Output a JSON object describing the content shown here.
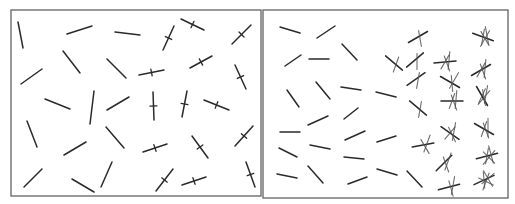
{
  "figure": {
    "width": 515,
    "height": 204,
    "stroke_color": "#2a2a2a",
    "frame_color": "#6e6e6e",
    "background": "#ffffff"
  },
  "panels": [
    {
      "id": "left",
      "frame": {
        "x": 11,
        "y": 10,
        "w": 250,
        "h": 186
      },
      "segments": [
        [
          18,
          22,
          23,
          48,
          0
        ],
        [
          67,
          34,
          92,
          26,
          0
        ],
        [
          115,
          32,
          140,
          35,
          0
        ],
        [
          163,
          50,
          174,
          26,
          1
        ],
        [
          181,
          19,
          204,
          30,
          1
        ],
        [
          232,
          44,
          251,
          25,
          1
        ],
        [
          21,
          84,
          42,
          69,
          0
        ],
        [
          63,
          51,
          80,
          73,
          0
        ],
        [
          107,
          59,
          126,
          78,
          0
        ],
        [
          139,
          75,
          164,
          70,
          1
        ],
        [
          190,
          68,
          212,
          56,
          1
        ],
        [
          235,
          65,
          246,
          89,
          1
        ],
        [
          45,
          99,
          70,
          109,
          0
        ],
        [
          90,
          124,
          94,
          91,
          0
        ],
        [
          107,
          110,
          129,
          97,
          0
        ],
        [
          153,
          92,
          154,
          120,
          1
        ],
        [
          182,
          117,
          187,
          91,
          1
        ],
        [
          204,
          100,
          229,
          110,
          1
        ],
        [
          27,
          121,
          37,
          147,
          0
        ],
        [
          106,
          127,
          124,
          148,
          0
        ],
        [
          64,
          155,
          86,
          142,
          0
        ],
        [
          143,
          152,
          167,
          144,
          1
        ],
        [
          192,
          136,
          208,
          158,
          1
        ],
        [
          235,
          146,
          253,
          126,
          1
        ],
        [
          24,
          187,
          42,
          169,
          0
        ],
        [
          72,
          179,
          94,
          192,
          0
        ],
        [
          101,
          187,
          112,
          162,
          0
        ],
        [
          156,
          191,
          173,
          169,
          1
        ],
        [
          182,
          185,
          206,
          177,
          1
        ],
        [
          246,
          162,
          255,
          187,
          1
        ]
      ]
    },
    {
      "id": "right",
      "frame": {
        "x": 263,
        "y": 10,
        "w": 245,
        "h": 188
      },
      "segments": [
        [
          280,
          27,
          300,
          33,
          0
        ],
        [
          317,
          38,
          335,
          26,
          0
        ],
        [
          285,
          66,
          301,
          55,
          0
        ],
        [
          309,
          59,
          329,
          59,
          0
        ],
        [
          342,
          44,
          357,
          60,
          0
        ],
        [
          287,
          90,
          299,
          107,
          0
        ],
        [
          316,
          82,
          330,
          99,
          0
        ],
        [
          341,
          87,
          361,
          90,
          0
        ],
        [
          376,
          92,
          396,
          97,
          0
        ],
        [
          308,
          125,
          328,
          116,
          0
        ],
        [
          344,
          119,
          358,
          108,
          0
        ],
        [
          280,
          132,
          300,
          132,
          0
        ],
        [
          279,
          148,
          297,
          157,
          0
        ],
        [
          310,
          145,
          330,
          149,
          0
        ],
        [
          345,
          140,
          365,
          131,
          0
        ],
        [
          377,
          142,
          396,
          136,
          0
        ],
        [
          344,
          157,
          364,
          159,
          0
        ],
        [
          277,
          174,
          297,
          178,
          0
        ],
        [
          308,
          166,
          323,
          183,
          0
        ],
        [
          348,
          184,
          367,
          177,
          0
        ],
        [
          377,
          169,
          397,
          175,
          0
        ],
        [
          407,
          171,
          422,
          187,
          0
        ]
      ],
      "tclusters": [
        {
          "x": 417,
          "y": 60,
          "n": 2,
          "a": [
            -40,
            90
          ]
        },
        {
          "x": 420,
          "y": 37,
          "n": 2,
          "a": [
            -30,
            80
          ]
        },
        {
          "x": 418,
          "y": 79,
          "n": 2,
          "a": [
            -35,
            100
          ]
        },
        {
          "x": 420,
          "y": 108,
          "n": 2,
          "a": [
            40,
            100
          ]
        },
        {
          "x": 425,
          "y": 145,
          "n": 3,
          "a": [
            -10,
            60,
            110
          ]
        },
        {
          "x": 396,
          "y": 63,
          "n": 2,
          "a": [
            40,
            110
          ]
        },
        {
          "x": 447,
          "y": 62,
          "n": 4,
          "a": [
            -5,
            70,
            95,
            120
          ]
        },
        {
          "x": 452,
          "y": 82,
          "n": 3,
          "a": [
            30,
            85,
            120
          ]
        },
        {
          "x": 454,
          "y": 101,
          "n": 4,
          "a": [
            0,
            70,
            95,
            110
          ]
        },
        {
          "x": 452,
          "y": 133,
          "n": 4,
          "a": [
            35,
            65,
            100,
            130
          ]
        },
        {
          "x": 446,
          "y": 163,
          "n": 3,
          "a": [
            -45,
            70,
            110
          ]
        },
        {
          "x": 451,
          "y": 187,
          "n": 3,
          "a": [
            -15,
            75,
            100
          ]
        },
        {
          "x": 485,
          "y": 37,
          "n": 5,
          "a": [
            20,
            60,
            80,
            100,
            120
          ]
        },
        {
          "x": 483,
          "y": 70,
          "n": 4,
          "a": [
            -30,
            70,
            95,
            120
          ]
        },
        {
          "x": 484,
          "y": 96,
          "n": 5,
          "a": [
            60,
            80,
            100,
            115,
            130
          ]
        },
        {
          "x": 486,
          "y": 129,
          "n": 4,
          "a": [
            30,
            70,
            90,
            110
          ]
        },
        {
          "x": 489,
          "y": 156,
          "n": 5,
          "a": [
            -15,
            45,
            75,
            100,
            130
          ]
        },
        {
          "x": 486,
          "y": 180,
          "n": 6,
          "a": [
            -25,
            25,
            60,
            85,
            110,
            140
          ]
        }
      ]
    }
  ]
}
